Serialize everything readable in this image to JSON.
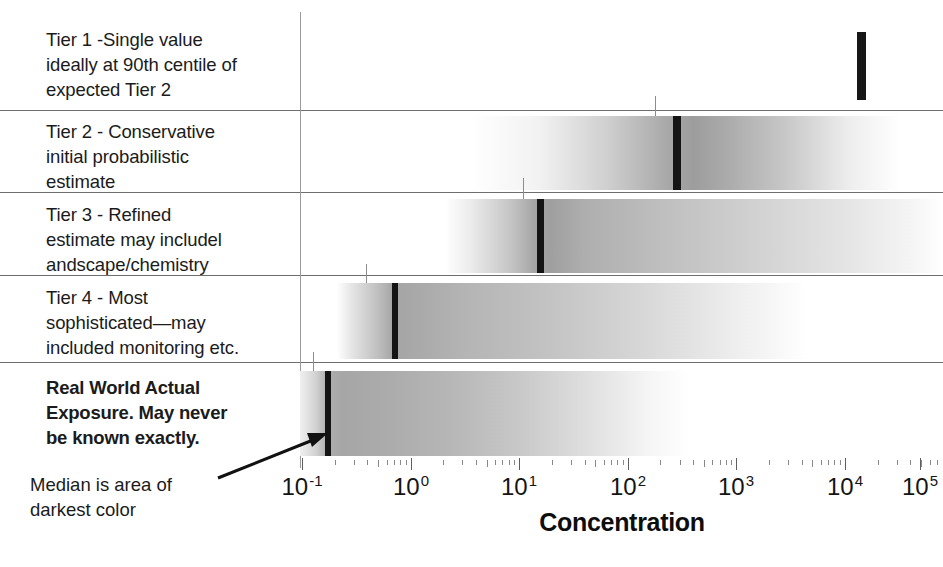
{
  "figure": {
    "axis_title": "Concentration",
    "median_note_line1": "Median is area of",
    "median_note_line2": "darkest color"
  },
  "rows": [
    {
      "id": "tier-1",
      "label_lines": [
        "Tier 1 -Single value",
        "ideally at 90th centile of",
        "expected Tier 2"
      ],
      "bold": false,
      "kind": "single-value",
      "single_value_log10": 4.62
    },
    {
      "id": "tier-2",
      "label_lines": [
        "Tier 2 - Conservative",
        "initial probabilistic",
        "estimate"
      ],
      "bold": false,
      "kind": "distribution",
      "band_start_log10": 1.56,
      "band_end_log10": 3.86,
      "median_log10": 2.42,
      "centile_tick_log10": 2.26
    },
    {
      "id": "tier-3",
      "label_lines": [
        "Tier 3 - Refined",
        "estimate may includel",
        "andscape/chemistry"
      ],
      "bold": false,
      "kind": "distribution",
      "band_start_log10": 0.41,
      "band_end_log10": 4.7,
      "median_log10": 1.18,
      "centile_tick_log10": 1.04
    },
    {
      "id": "tier-4",
      "label_lines": [
        "Tier 4 - Most",
        "sophisticated—may",
        "included monitoring etc."
      ],
      "bold": false,
      "kind": "distribution",
      "band_start_log10": -0.6,
      "band_end_log10": 3.5,
      "median_log10": -0.15,
      "centile_tick_log10": -0.4
    },
    {
      "id": "real-world",
      "label_lines": [
        "Real World Actual",
        "Exposure.  May never",
        "be known exactly."
      ],
      "bold": true,
      "kind": "distribution",
      "band_start_log10": -0.97,
      "band_end_log10": 2.3,
      "median_log10": -0.77,
      "centile_tick_log10": -0.9
    }
  ],
  "axis": {
    "scale": "log10",
    "min_log10": -1.1,
    "max_log10": 5.35,
    "decades": [
      {
        "exponent": "-1",
        "log10": -1
      },
      {
        "exponent": "0",
        "log10": 0
      },
      {
        "exponent": "1",
        "log10": 1
      },
      {
        "exponent": "2",
        "log10": 2
      },
      {
        "exponent": "3",
        "log10": 3
      },
      {
        "exponent": "4",
        "log10": 4
      },
      {
        "exponent": "5",
        "log10": 5
      }
    ],
    "minor_multipliers": [
      2,
      3,
      4,
      5,
      6,
      7,
      8,
      9
    ],
    "base_text": "10"
  },
  "chart_data": {
    "type": "bar",
    "xlabel": "Concentration",
    "ylabel": "",
    "x_scale": "log10",
    "xlim_log10": [
      -1.1,
      5.35
    ],
    "categories": [
      "Tier 1 -Single value ideally at 90th centile of expected Tier 2",
      "Tier 2 - Conservative initial probabilistic estimate",
      "Tier 3 - Refined estimate may includel andscape/chemistry",
      "Tier 4 - Most sophisticated—may included monitoring etc.",
      "Real World Actual Exposure.  May never be known exactly."
    ],
    "series": [
      {
        "name": "band start (log10 concentration)",
        "values": [
          null,
          1.56,
          0.41,
          -0.6,
          -0.97
        ]
      },
      {
        "name": "band end (log10 concentration)",
        "values": [
          null,
          3.86,
          4.7,
          3.5,
          2.3
        ]
      },
      {
        "name": "median / darkest color (log10 concentration)",
        "values": [
          4.62,
          2.42,
          1.18,
          -0.15,
          -0.77
        ]
      },
      {
        "name": "90th centile tick (log10 concentration)",
        "values": [
          null,
          2.26,
          1.04,
          -0.4,
          -0.9
        ]
      }
    ],
    "tick_labels": [
      "10^-1",
      "10^0",
      "10^1",
      "10^2",
      "10^3",
      "10^4",
      "10^5"
    ],
    "annotations": [
      "Median is area of darkest color"
    ],
    "grid": false,
    "legend": "none"
  },
  "colors": {
    "median_bar": "#141414",
    "single_bar": "#171717",
    "separator": "#6e6e6e",
    "spine": "#9a9a9a",
    "text": "#1b1b1b",
    "band_dark": "#9d9d9d",
    "band_light": "#ffffff"
  }
}
